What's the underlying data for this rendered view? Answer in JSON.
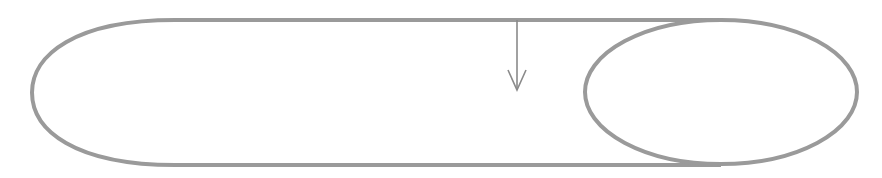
{
  "diagram": {
    "type": "cylinder-side-view",
    "stroke_color": "#9a9a9a",
    "arrow_color": "#8a8a8a",
    "background": "#ffffff",
    "shapes": {
      "body_outline": {
        "top_y": 20,
        "bottom_y": 165,
        "left_x": 32,
        "left_cap_join_x": 175
      },
      "right_end_ellipse": {
        "cx": 721,
        "cy": 92,
        "rx": 136,
        "ry": 72
      },
      "arrow": {
        "x": 517,
        "from_y": 20,
        "to_y": 90,
        "direction": "down"
      }
    },
    "labels": []
  }
}
